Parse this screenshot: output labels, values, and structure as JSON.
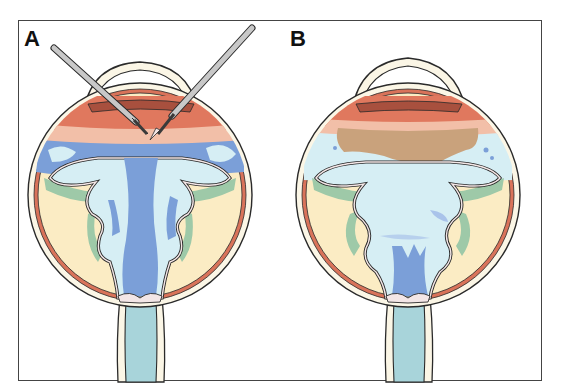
{
  "figure": {
    "panels": [
      {
        "id": "A",
        "label": "A",
        "description": "Eye cross-section with two surgical instruments inserted through the pars plana; funnel-shaped retinal detachment with blue fluid"
      },
      {
        "id": "B",
        "label": "B",
        "description": "Eye cross-section after procedure; tan/brown layer beneath lens, lighter fluid in funnel detachment"
      }
    ]
  },
  "colors": {
    "sclera_outline": "#2a2a2a",
    "sclera_fill": "#fbf6e6",
    "choroid": "#d9735a",
    "ciliary": "#e0785e",
    "iris_dark": "#a8503e",
    "vitreous_bg": "#fbecc4",
    "retina_outline": "#2a2a2a",
    "retina_fill": "#f3e6e6",
    "subretinal_green": "#9ec9a8",
    "fluid_light": "#d6eef4",
    "fluid_blue": "#7b9fd8",
    "pink_band": "#f2bfa8",
    "tan_layer": "#c9a27c",
    "optic_nerve": "#a8d4da",
    "instrument": "#c8c8c8",
    "instrument_dark": "#3a3a3a"
  }
}
